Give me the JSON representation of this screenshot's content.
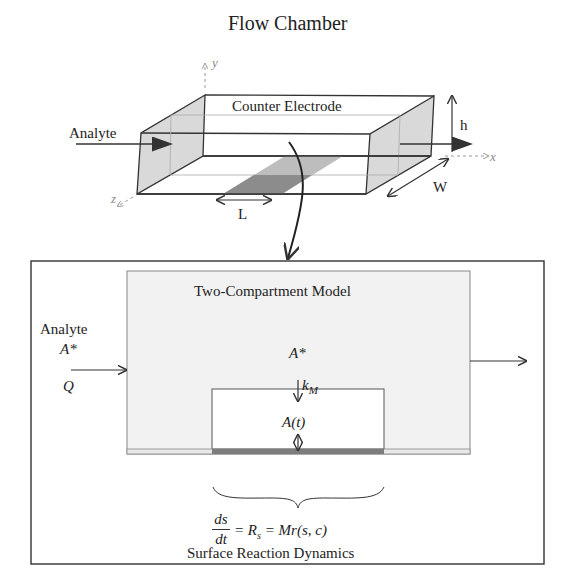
{
  "top": {
    "title": "Flow Chamber",
    "counter_electrode_label": "Counter Electrode",
    "inlet_label": "Analyte",
    "axes": {
      "x": "x",
      "y": "y",
      "z": "z"
    },
    "dimensions": {
      "height": "h",
      "width": "W",
      "length": "L"
    }
  },
  "bottom": {
    "model_title": "Two-Compartment Model",
    "inlet": {
      "label": "Analyte",
      "concentration": "A*",
      "flow": "Q"
    },
    "bulk_concentration": "A*",
    "mass_transport": "k",
    "mass_transport_sub": "M",
    "inner_compartment": "A(t)",
    "equation": {
      "numerator": "ds",
      "denominator": "dt",
      "rhs": "= R",
      "rhs_sub": "s",
      "rhs2": " = Mr(s, c)"
    },
    "caption": "Surface Reaction Dynamics"
  },
  "colors": {
    "stroke": "#333333",
    "panel_fill": "#f2f2f2",
    "face_fill": "#d9d9d9",
    "electrode_dark": "#8c8c8c",
    "electrode_light": "#bdbdbd"
  }
}
